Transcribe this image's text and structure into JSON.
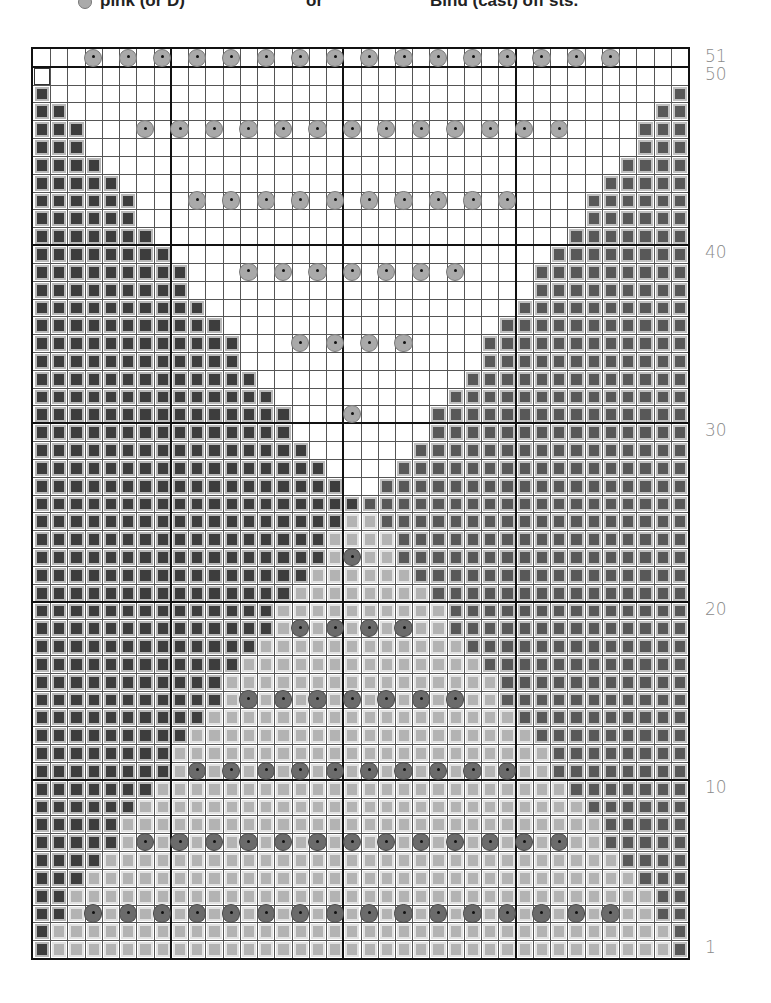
{
  "legend": {
    "items": [
      {
        "bullet": "pink-bead-icon",
        "label": "pink (or D)",
        "x": 78
      },
      {
        "label": "or",
        "x": 306
      },
      {
        "label": "Bind (cast) off sts.",
        "x": 430
      }
    ]
  },
  "chart_data": {
    "type": "heatmap",
    "columns": 38,
    "rows": 51,
    "row_labels": [
      {
        "row": 51,
        "label": "51"
      },
      {
        "row": 50,
        "label": "50"
      },
      {
        "row": 40,
        "label": "40"
      },
      {
        "row": 30,
        "label": "30"
      },
      {
        "row": 20,
        "label": "20"
      },
      {
        "row": 10,
        "label": "10"
      },
      {
        "row": 1,
        "label": "1"
      }
    ],
    "thick_column_lines_after": [
      8,
      18,
      28
    ],
    "thick_row_lines_below": [
      51,
      41,
      31,
      21,
      11
    ],
    "colors": {
      "dark": "#3d3d3d",
      "medium": "#585858",
      "light": "#b3b3b3",
      "white": "#ffffff"
    },
    "side_counts_by_row": {
      "note": "number of dark cells on left (mirrored as medium on right), rows 1..50",
      "values": [
        1,
        1,
        2,
        2,
        3,
        4,
        5,
        5,
        6,
        7,
        8,
        8,
        9,
        10,
        11,
        11,
        12,
        13,
        14,
        14,
        15,
        16,
        17,
        17,
        18,
        19,
        18,
        17,
        16,
        15,
        15,
        14,
        13,
        12,
        12,
        11,
        10,
        9,
        9,
        8,
        7,
        6,
        6,
        5,
        4,
        3,
        3,
        2,
        1,
        0
      ]
    },
    "light_region": {
      "note": "bottom light triangle spans between side blocks for rows 1..25"
    },
    "white_region": {
      "note": "top white V spans between side blocks for rows 27..50 and all of row 51"
    },
    "outlined_cell": {
      "row": 50,
      "col": 1,
      "meaning": "bind (cast) off sts."
    },
    "beads": [
      {
        "row": 51,
        "cols": [
          4,
          6,
          8,
          10,
          12,
          14,
          16,
          18,
          20,
          22,
          24,
          26,
          28,
          30,
          32,
          34
        ],
        "tone": "pale"
      },
      {
        "row": 47,
        "cols": [
          7,
          9,
          11,
          13,
          15,
          17,
          19,
          21,
          23,
          25,
          27,
          29,
          31
        ],
        "tone": "pale"
      },
      {
        "row": 43,
        "cols": [
          10,
          12,
          14,
          16,
          18,
          20,
          22,
          24,
          26,
          28
        ],
        "tone": "pale"
      },
      {
        "row": 39,
        "cols": [
          13,
          15,
          17,
          19,
          21,
          23,
          25
        ],
        "tone": "pale"
      },
      {
        "row": 35,
        "cols": [
          16,
          18,
          20,
          22
        ],
        "tone": "pale"
      },
      {
        "row": 31,
        "cols": [
          19
        ],
        "tone": "pale"
      },
      {
        "row": 23,
        "cols": [
          19
        ],
        "tone": "dark"
      },
      {
        "row": 19,
        "cols": [
          16,
          18,
          20,
          22
        ],
        "tone": "dark"
      },
      {
        "row": 15,
        "cols": [
          13,
          15,
          17,
          19,
          21,
          23,
          25
        ],
        "tone": "dark"
      },
      {
        "row": 11,
        "cols": [
          10,
          12,
          14,
          16,
          18,
          20,
          22,
          24,
          26,
          28
        ],
        "tone": "dark"
      },
      {
        "row": 7,
        "cols": [
          7,
          9,
          11,
          13,
          15,
          17,
          19,
          21,
          23,
          25,
          27,
          29,
          31
        ],
        "tone": "dark"
      },
      {
        "row": 3,
        "cols": [
          4,
          6,
          8,
          10,
          12,
          14,
          16,
          18,
          20,
          22,
          24,
          26,
          28,
          30,
          32,
          34
        ],
        "tone": "dark"
      }
    ]
  }
}
